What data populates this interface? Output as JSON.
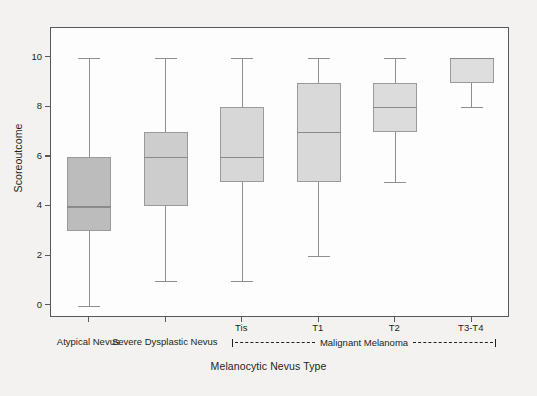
{
  "figure": {
    "background_color": "#f3f2f0",
    "plot_background_color": "#fdfdfd",
    "frame_color": "#58595b"
  },
  "chart_data": {
    "type": "box",
    "title": "",
    "xlabel": "Melanocytic Nevus Type",
    "ylabel": "Scoreoutcome",
    "ylim": [
      -0.5,
      11.2
    ],
    "yticks": [
      0,
      2,
      4,
      6,
      8,
      10
    ],
    "ytick_labels": [
      "0",
      "2",
      "4",
      "6",
      "8",
      "10"
    ],
    "grid": false,
    "legend": "none",
    "categories": [
      "Atypical Nevus",
      "Severe Dysplastic Nevus",
      "Tis",
      "T1",
      "T2",
      "T3-T4"
    ],
    "group_bracket": {
      "label": "Malignant Melanoma",
      "covers": [
        "Tis",
        "T1",
        "T2",
        "T3-T4"
      ]
    },
    "boxes": [
      {
        "category": "Atypical Nevus",
        "whisker_low": 0,
        "q1": 3,
        "median": 4,
        "q3": 6,
        "whisker_high": 10,
        "fill": "#bcbcbc"
      },
      {
        "category": "Severe Dysplastic Nevus",
        "whisker_low": 1,
        "q1": 4,
        "median": 6,
        "q3": 7,
        "whisker_high": 10,
        "fill": "#cdcdcd"
      },
      {
        "category": "Tis",
        "whisker_low": 1,
        "q1": 5,
        "median": 6,
        "q3": 8,
        "whisker_high": 10,
        "fill": "#d7d7d7"
      },
      {
        "category": "T1",
        "whisker_low": 2,
        "q1": 5,
        "median": 7,
        "q3": 9,
        "whisker_high": 10,
        "fill": "#d9d9d9"
      },
      {
        "category": "T2",
        "whisker_low": 5,
        "q1": 7,
        "median": 8,
        "q3": 9,
        "whisker_high": 10,
        "fill": "#dcdcdc"
      },
      {
        "category": "T3-T4",
        "whisker_low": 8,
        "q1": 9,
        "median": 10,
        "q3": 10,
        "whisker_high": 10,
        "fill": "#dedede"
      }
    ]
  },
  "axis": {
    "y_title": "Scoreoutcome",
    "x_title": "Melanocytic Nevus Type",
    "x_tick_labels": [
      "",
      "",
      "Tis",
      "T1",
      "T2",
      "T3-T4"
    ],
    "x_category_labels": [
      "Atypical Nevus",
      "Severe Dysplastic Nevus",
      "",
      "",
      "",
      ""
    ],
    "bracket_label": "Malignant Melanoma"
  }
}
